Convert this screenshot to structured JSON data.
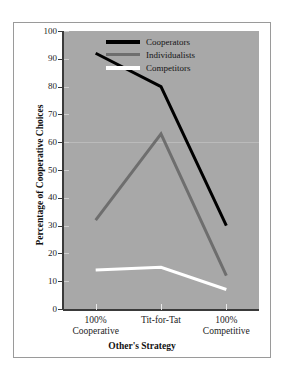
{
  "chart_data": {
    "type": "line",
    "title": "",
    "xlabel": "Other's Strategy",
    "ylabel": "Percentage of Cooperative Choices",
    "categories": [
      "100%\nCooperative",
      "Tit-for-Tat",
      "100%\nCompetitive"
    ],
    "category_lines": [
      {
        "line1": "100%",
        "line2": "Cooperative"
      },
      {
        "line1": "Tit-for-Tat",
        "line2": ""
      },
      {
        "line1": "100%",
        "line2": "Competitive"
      }
    ],
    "series": [
      {
        "name": "Cooperators",
        "values": [
          92,
          80,
          30
        ],
        "color": "#000000"
      },
      {
        "name": "Individualists",
        "values": [
          32,
          63,
          12
        ],
        "color": "#6e6e6e"
      },
      {
        "name": "Competitors",
        "values": [
          14,
          15,
          7
        ],
        "color": "#ffffff"
      }
    ],
    "ylim": [
      0,
      100
    ],
    "yticks": [
      0,
      10,
      20,
      30,
      40,
      50,
      60,
      70,
      80,
      90,
      100
    ],
    "ytick_labels": [
      "0",
      "10",
      "20",
      "30",
      "40",
      "50",
      "60",
      "70",
      "80",
      "90",
      "100"
    ],
    "grid": true,
    "gridlines": [
      60
    ],
    "legend_position": "top-right",
    "plot_background": "#a8a8a8",
    "figure_background": "#ffffff",
    "border_color": "#9a9a9a"
  },
  "legend": {
    "entries": [
      {
        "label": "Cooperators"
      },
      {
        "label": "Individualists"
      },
      {
        "label": "Competitors"
      }
    ]
  }
}
